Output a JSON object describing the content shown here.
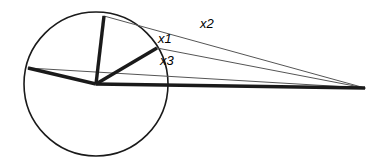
{
  "figure": {
    "name": "circle-with-converging-rays-diagram",
    "background_color": "#ffffff",
    "stroke_color": "#1a1a1a",
    "thin_stroke_color": "#555555",
    "width": 380,
    "height": 162,
    "circle": {
      "label": "circle",
      "center_x": 96,
      "center_y": 84,
      "radius": 72,
      "stroke_width": 1.6
    },
    "apex": {
      "label": "convergence-point",
      "x": 365,
      "y": 88
    },
    "bold_segments": [
      {
        "name": "radius-top",
        "x1": 96,
        "y1": 84,
        "x2": 104,
        "y2": 16,
        "stroke_width": 3.4
      },
      {
        "name": "radius-upper-right",
        "x1": 96,
        "y1": 84,
        "x2": 157,
        "y2": 48,
        "stroke_width": 3.4
      },
      {
        "name": "radius-left",
        "x1": 96,
        "y1": 84,
        "x2": 28,
        "y2": 68,
        "stroke_width": 3.4
      },
      {
        "name": "baseline-to-apex",
        "x1": 96,
        "y1": 84,
        "x2": 365,
        "y2": 88,
        "stroke_width": 3.4
      }
    ],
    "thin_rays": [
      {
        "name": "ray-x2",
        "x1": 104,
        "y1": 16,
        "x2": 365,
        "y2": 88,
        "stroke_width": 1.0
      },
      {
        "name": "ray-x1",
        "x1": 157,
        "y1": 48,
        "x2": 365,
        "y2": 88,
        "stroke_width": 1.0
      },
      {
        "name": "ray-x3",
        "x1": 28,
        "y1": 68,
        "x2": 365,
        "y2": 88,
        "stroke_width": 1.0
      }
    ],
    "labels": [
      {
        "name": "angle-label-x1",
        "text": "x1",
        "x": 158,
        "y": 32,
        "font_size": 13
      },
      {
        "name": "angle-label-x2",
        "text": "x2",
        "x": 200,
        "y": 17,
        "font_size": 13
      },
      {
        "name": "angle-label-x3",
        "text": "x3",
        "x": 160,
        "y": 54,
        "font_size": 13
      }
    ]
  }
}
